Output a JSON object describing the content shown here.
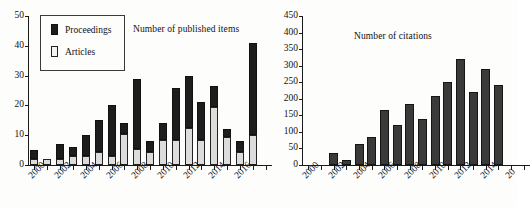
{
  "figure": {
    "background": "#fdfdfc",
    "ink": "#1a1a1a"
  },
  "chart_data": [
    {
      "id": "published-items",
      "type": "bar",
      "stacked": true,
      "title": "Number of published items",
      "xlabel": "",
      "ylabel": "",
      "ylim": [
        0,
        50
      ],
      "ytick_values": [
        0,
        10,
        20,
        30,
        40,
        50
      ],
      "ytick_labels": [
        "0",
        "10",
        "20",
        "30",
        "40",
        "50"
      ],
      "grid": false,
      "legend": {
        "position": "upper-left",
        "entries": [
          {
            "name": "Proceedings",
            "color": "#1d1d1d"
          },
          {
            "name": "Articles",
            "color": "#f4f4f4"
          }
        ]
      },
      "categories": [
        2000,
        2001,
        2002,
        2003,
        2004,
        2005,
        2006,
        2007,
        2008,
        2009,
        2010,
        2011,
        2012,
        2013,
        2014,
        2015,
        2016,
        2017,
        2018
      ],
      "xtick_labels": [
        "2000",
        "2002",
        "2004",
        "2006",
        "2008",
        "2010",
        "2012",
        "2014",
        "2016"
      ],
      "xtick_labeled_years": [
        2000,
        2002,
        2004,
        2006,
        2008,
        2010,
        2012,
        2014,
        2016
      ],
      "series": [
        {
          "name": "Articles",
          "color": "#dcdcdc",
          "values": [
            2,
            2,
            2,
            3,
            3,
            4.5,
            3,
            10.5,
            5.5,
            4.5,
            8.5,
            8.5,
            12.5,
            8.5,
            19.5,
            9.5,
            4.5,
            10,
            0
          ]
        },
        {
          "name": "Proceedings",
          "color": "#1d1d1d",
          "values": [
            3,
            0,
            5,
            3,
            7,
            10.5,
            17,
            3.5,
            23.5,
            3.5,
            5.5,
            17.5,
            17.5,
            12.5,
            7,
            2.5,
            3.5,
            31,
            0
          ]
        }
      ],
      "totals": [
        5,
        2,
        7,
        6,
        10,
        15,
        20,
        14,
        29,
        8,
        14,
        26,
        30,
        21,
        26.5,
        12,
        8,
        41,
        0
      ]
    },
    {
      "id": "citations",
      "type": "bar",
      "stacked": false,
      "title": "Number of citations",
      "xlabel": "",
      "ylabel": "",
      "ylim": [
        0,
        450
      ],
      "ytick_values": [
        0,
        50,
        100,
        150,
        200,
        250,
        300,
        350,
        400,
        450
      ],
      "ytick_labels": [
        "0",
        "50",
        "100",
        "150",
        "200",
        "250",
        "300",
        "350",
        "400",
        "450"
      ],
      "grid": false,
      "categories": [
        2000,
        2001,
        2002,
        2003,
        2004,
        2005,
        2006,
        2007,
        2008,
        2009,
        2010,
        2011,
        2012,
        2013,
        2014,
        2015,
        2016,
        2017
      ],
      "xtick_labels": [
        "2000",
        "2002",
        "2004",
        "2006",
        "2008",
        "2010",
        "2012",
        "2014",
        "20"
      ],
      "xtick_labeled_years": [
        2000,
        2002,
        2004,
        2006,
        2008,
        2010,
        2012,
        2014,
        2016
      ],
      "series": [
        {
          "name": "Citations",
          "color": "#3a3a3a",
          "values": [
            0,
            0,
            36,
            15,
            65,
            85,
            165,
            120,
            185,
            138,
            208,
            250,
            320,
            220,
            290,
            243,
            0,
            0
          ]
        }
      ],
      "clipped_right_edge": true
    }
  ]
}
